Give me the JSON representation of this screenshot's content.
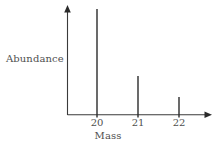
{
  "figure": {
    "background_color": "#ffffff",
    "line_color": "#2b2b2b",
    "text_color": "#4f4f4f"
  },
  "axes": {
    "y_axis_label": "Abundance",
    "x_axis_label": "Mass",
    "y_axis_has_arrow": true,
    "x_axis_has_arrow": true,
    "x_origin_px": 67,
    "x_end_px": 212,
    "y_top_px": 6,
    "y_baseline_px": 115
  },
  "chart_data": {
    "type": "bar",
    "title": "",
    "subtitle": "",
    "xlabel": "Mass",
    "ylabel": "Abundance",
    "categories": [
      "20",
      "21",
      "22"
    ],
    "values": [
      100,
      37,
      17
    ],
    "x": [
      20,
      21,
      22
    ],
    "xlim": [
      19.3,
      22.8
    ],
    "ylim": [
      0,
      103
    ],
    "grid": false,
    "legend": null,
    "tick_labels_x": [
      "20",
      "21",
      "22"
    ],
    "tick_labels_y": [],
    "annotations": [],
    "bars": [
      {
        "label": "20",
        "value": 100,
        "x_px": 97,
        "top_px": 9,
        "width_px": 1.4
      },
      {
        "label": "21",
        "value": 37,
        "x_px": 138,
        "top_px": 76,
        "width_px": 1.4
      },
      {
        "label": "22",
        "value": 17,
        "x_px": 179,
        "top_px": 97,
        "width_px": 1.4
      }
    ]
  }
}
